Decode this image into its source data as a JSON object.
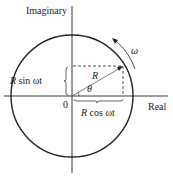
{
  "labels": {
    "y_axis": "Imaginary",
    "x_axis": "Real",
    "origin": "0",
    "radius": "R",
    "angle": "θ",
    "omega": "ω",
    "sin_component_R": "R",
    "sin_component_rest": " sin ωt",
    "cos_component_R": "R",
    "cos_component_rest": " cos ωt"
  },
  "geometry": {
    "center": [
      72,
      96
    ],
    "radius": 61,
    "point": [
      123,
      66
    ]
  },
  "colors": {
    "stroke": "#222222",
    "background": "#ffffff"
  }
}
